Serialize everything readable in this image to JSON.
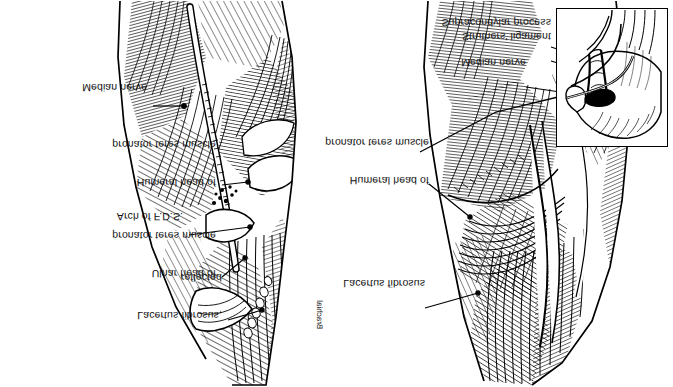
{
  "figure": {
    "domain": "anatomical-illustration",
    "orientation": "image presented upside-down (180 degrees rotated / vertically flipped)",
    "background_color": "#ffffff",
    "ink_color": "#000000",
    "width": 673,
    "height": 387,
    "panel_count": 2
  },
  "panels": {
    "left": {
      "name": "deep-dissection-panel",
      "description": "Deep dissection of the cubital fossa with lacertus fibrosus reflected and pronator teres heads separated, exposing the median nerve",
      "labels": [
        {
          "id": "lacertus-fibrosus-reflected",
          "lines": [
            "Lacertus fibrosus,",
            "reflected"
          ],
          "text": "Lacertus fibrosus, reflected",
          "align": "right",
          "x": 222,
          "y": 47,
          "leader": {
            "x1": 228,
            "y1": 67,
            "x2": 260,
            "y2": 76
          }
        },
        {
          "id": "ulnar-head-of-pronator-teres-muscle",
          "lines": [
            "Ulnar head of",
            "pronator teres muscle"
          ],
          "text": "Ulnar head of pronator teres muscle",
          "align": "right",
          "x": 216,
          "y": 89,
          "leader": {
            "x1": 222,
            "y1": 110,
            "x2": 243,
            "y2": 128
          }
        },
        {
          "id": "arch-of-fds",
          "lines": [
            "Arch of F.D.S."
          ],
          "text": "Arch of F.D.S.",
          "align": "right",
          "x": 183,
          "y": 146,
          "leader": {
            "x1": 189,
            "y1": 152,
            "x2": 249,
            "y2": 160
          }
        },
        {
          "id": "humeral-head-of-pronator-teres-muscle",
          "lines": [
            "Humeral head of",
            "pronator teres muscle"
          ],
          "text": "Humeral head of pronator teres muscle",
          "align": "right",
          "x": 216,
          "y": 180,
          "leader": {
            "x1": 222,
            "y1": 202,
            "x2": 247,
            "y2": 205
          }
        },
        {
          "id": "median-nerve",
          "lines": [
            "Median nerve"
          ],
          "text": "Median nerve",
          "align": "right",
          "x": 147,
          "y": 275,
          "leader": {
            "x1": 153,
            "y1": 281,
            "x2": 183,
            "y2": 281
          }
        },
        {
          "id": "brachial-vessels",
          "lines": [
            "Brachial"
          ],
          "text": "Brachial",
          "align": "vertical",
          "x": 303,
          "y": 44,
          "leader": null
        }
      ]
    },
    "right": {
      "name": "superficial-dissection-panel",
      "description": "Superficial view of the cubital fossa with intact lacertus fibrosus, with an inset of the supracondylar process and Struthers' ligament",
      "labels": [
        {
          "id": "lacertus-fibrosus",
          "lines": [
            "Lacertus fibrosus"
          ],
          "text": "Lacertus fibrosus",
          "align": "right",
          "x": 419,
          "y": 73,
          "leader": {
            "x1": 425,
            "y1": 79,
            "x2": 478,
            "y2": 94
          }
        },
        {
          "id": "humeral-head-of-pronator-teres-muscle",
          "lines": [
            "Humeral head of",
            "pronator teres muscle"
          ],
          "text": "Humeral head of pronator teres muscle",
          "align": "right",
          "x": 423,
          "y": 182,
          "leader": {
            "x1": 429,
            "y1": 203,
            "x2": 470,
            "y2": 170
          }
        },
        {
          "id": "median-nerve",
          "lines": [
            "Median nerve"
          ],
          "text": "Median nerve",
          "align": "right",
          "x": 520,
          "y": 294,
          "leader": {
            "x1": 526,
            "y1": 300,
            "x2": 606,
            "y2": 288
          }
        },
        {
          "id": "struthers-ligament",
          "lines": [
            "Struthers' ligament"
          ],
          "text": "Struthers' ligament",
          "align": "right",
          "x": 545,
          "y": 320,
          "leader": {
            "x1": 551,
            "y1": 326,
            "x2": 600,
            "y2": 310
          }
        },
        {
          "id": "supracondylar-process",
          "lines": [
            "Supracondylar process"
          ],
          "text": "Supracondylar process",
          "align": "right",
          "x": 545,
          "y": 334,
          "leader": {
            "x1": 551,
            "y1": 340,
            "x2": 598,
            "y2": 323
          }
        }
      ],
      "inset": {
        "id": "supracondylar-process-inset",
        "description": "Close-up of distal humerus showing supracondylar process, Struthers' ligament and median nerve",
        "x": 556,
        "y": 240,
        "width": 112,
        "height": 139,
        "border_color": "#000000",
        "callout": {
          "x1": 420,
          "y1": 235,
          "x2": 556,
          "y2": 290
        }
      }
    }
  }
}
